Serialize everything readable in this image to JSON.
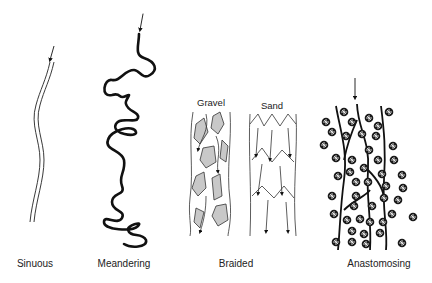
{
  "figure": {
    "panels": [
      {
        "id": "sinuous",
        "label": "Sinuous",
        "label_x": 35
      },
      {
        "id": "meandering",
        "label": "Meandering",
        "label_x": 124
      },
      {
        "id": "braided",
        "label": "Braided",
        "label_x": 236,
        "sublabels": [
          {
            "label": "Gravel",
            "x": 211
          },
          {
            "label": "Sand",
            "x": 261
          }
        ]
      },
      {
        "id": "anastomosing",
        "label": "Anastomosing",
        "label_x": 379
      }
    ],
    "colors": {
      "line": "#111111",
      "bar_fill": "#c8c8c8",
      "background": "#ffffff"
    }
  }
}
